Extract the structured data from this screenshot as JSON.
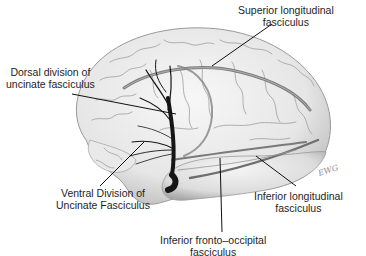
{
  "figure": {
    "colors": {
      "background": "#ffffff",
      "brain_fill": "#ececec",
      "brain_shadow": "#b9b9b9",
      "sulci": "#8f8f8f",
      "tract": "#6e6e6e",
      "uncinate": "#1a1a1a",
      "leader_line": "#111111",
      "label_text": "#1e1e1e"
    },
    "signature": "EWG"
  },
  "labels": {
    "superior_longitudinal": {
      "line1": "Superior longitudinal",
      "line2": "fasciculus"
    },
    "dorsal_uncinate": {
      "line1": "Dorsal division of",
      "line2": "uncinate fasciculus"
    },
    "ventral_uncinate": {
      "line1": "Ventral Division of",
      "line2": "Uncinate Fasciculus"
    },
    "inferior_longitudinal": {
      "line1": "Inferior longitudinal",
      "line2": "fasciculus"
    },
    "inferior_fronto_occipital": {
      "line1": "Inferior fronto–occipital",
      "line2": "fasciculus"
    }
  }
}
